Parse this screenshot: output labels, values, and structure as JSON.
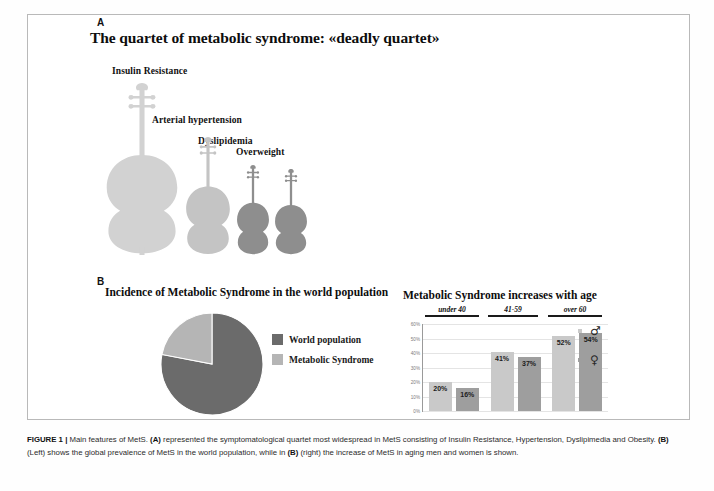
{
  "panels": {
    "a_letter": "A",
    "b_letter": "B",
    "a_title": "The quartet of metabolic syndrome: «deadly quartet»"
  },
  "quartet": {
    "instruments": [
      {
        "name": "double-bass",
        "label": "Insulin  Resistance",
        "color": "#d2d2d2"
      },
      {
        "name": "cello",
        "label": "Arterial  hypertension",
        "color": "#c4c4c4"
      },
      {
        "name": "viola",
        "label": "Dyslipidemia",
        "color": "#8e8e8e"
      },
      {
        "name": "violin",
        "label": "Overweight",
        "color": "#8e8e8e"
      }
    ]
  },
  "pie": {
    "title": "Incidence of Metabolic Syndrome in the world population",
    "legend": [
      {
        "label": "World population",
        "color": "#6b6b6b"
      },
      {
        "label": "Metabolic Syndrome",
        "color": "#b5b5b5"
      }
    ]
  },
  "bar": {
    "title": "Metabolic Syndrome increases with age",
    "age_groups": [
      "under 40",
      "41-59",
      "over 60"
    ],
    "y_ticks": [
      "60%",
      "50%",
      "40%",
      "30%",
      "20%",
      "10%",
      "0%"
    ],
    "legend": [
      {
        "symbol": "♂",
        "name": "male",
        "color": "#c9c9c9"
      },
      {
        "symbol": "♀",
        "name": "female",
        "color": "#9e9e9e"
      }
    ],
    "values": [
      "20%",
      "16%",
      "41%",
      "37%",
      "52%",
      "54%"
    ]
  },
  "chart_data": [
    {
      "type": "pie",
      "title": "Incidence of Metabolic Syndrome in the world population",
      "labels": [
        "World population",
        "Metabolic Syndrome"
      ],
      "values": [
        78,
        22
      ],
      "colors": [
        "#6b6b6b",
        "#b5b5b5"
      ],
      "legend_position": "right",
      "start_angle": 90,
      "direction": "counterclockwise"
    },
    {
      "type": "bar",
      "title": "Metabolic Syndrome increases with age",
      "categories": [
        "under 40",
        "41-59",
        "over 60"
      ],
      "series": [
        {
          "name": "male",
          "symbol": "♂",
          "values": [
            20,
            41,
            52
          ],
          "color": "#c9c9c9"
        },
        {
          "name": "female",
          "symbol": "♀",
          "values": [
            16,
            37,
            54
          ],
          "color": "#9e9e9e"
        }
      ],
      "xlabel": "",
      "ylabel": "",
      "ylim": [
        0,
        60
      ],
      "ytick_labels": [
        "0%",
        "10%",
        "20%",
        "30%",
        "40%",
        "50%",
        "60%"
      ],
      "grid": true,
      "data_labels": [
        "20%",
        "16%",
        "41%",
        "37%",
        "52%",
        "54%"
      ],
      "legend_position": "right"
    }
  ],
  "caption": {
    "figure_label": "FIGURE 1",
    "separator": "|",
    "part1": " Main features of MetS. ",
    "bold_a": "(A)",
    "part2": " represented the symptomatological quartet most widespread in MetS consisting of Insulin Resistance, Hypertension, Dyslipimedia and Obesity. ",
    "bold_b1": "(B)",
    "part3": " (Left) shows the global prevalence of MetS in the world population, while in ",
    "bold_b2": "(B)",
    "part4": " (right) the increase of MetS in aging men and women is shown."
  }
}
